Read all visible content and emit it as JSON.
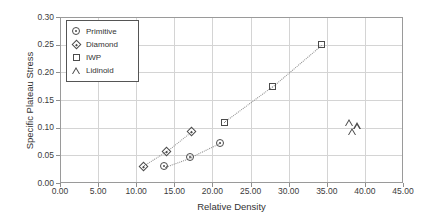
{
  "chart_data": {
    "type": "scatter",
    "title": "",
    "xlabel": "Relative Density",
    "ylabel": "Specific Plateau Stress",
    "xlim": [
      0,
      45
    ],
    "ylim": [
      0,
      0.3
    ],
    "xticks": [
      "0.00",
      "5.00",
      "10.00",
      "15.00",
      "20.00",
      "25.00",
      "30.00",
      "35.00",
      "40.00",
      "45.00"
    ],
    "yticks": [
      "0.00",
      "0.05",
      "0.10",
      "0.15",
      "0.20",
      "0.25",
      "0.30"
    ],
    "grid": true,
    "legend_position": "top-left",
    "connector_style": "dotted",
    "series": [
      {
        "name": "Primitive",
        "marker": "circle",
        "points": [
          [
            13.6,
            0.031
          ],
          [
            17.0,
            0.048
          ],
          [
            20.9,
            0.074
          ]
        ]
      },
      {
        "name": "Diamond",
        "marker": "diamond",
        "points": [
          [
            10.8,
            0.032
          ],
          [
            13.9,
            0.059
          ],
          [
            17.1,
            0.094
          ]
        ]
      },
      {
        "name": "IWP",
        "marker": "square",
        "points": [
          [
            21.4,
            0.112
          ],
          [
            27.7,
            0.176
          ],
          [
            34.2,
            0.252
          ]
        ]
      },
      {
        "name": "Lidinoid",
        "marker": "triangle",
        "points": [
          [
            37.9,
            0.111
          ],
          [
            38.9,
            0.105
          ],
          [
            38.2,
            0.095
          ]
        ]
      }
    ]
  },
  "legend": {
    "items": [
      {
        "label": "Primitive",
        "marker": "circle"
      },
      {
        "label": "Diamond",
        "marker": "diamond"
      },
      {
        "label": "IWP",
        "marker": "square"
      },
      {
        "label": "Lidinoid",
        "marker": "triangle"
      }
    ]
  },
  "colors": {
    "marker": "#4b4b4b",
    "grid": "#d4d4d4",
    "frame": "#9a9a9a",
    "text": "#333333",
    "background": "#ffffff"
  }
}
